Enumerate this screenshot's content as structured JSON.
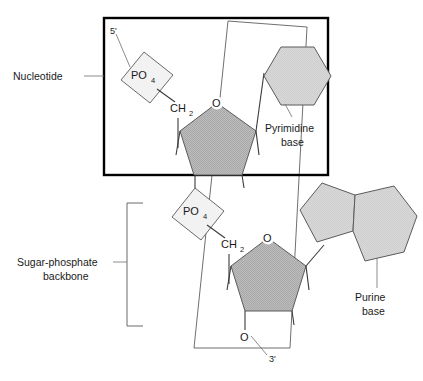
{
  "figure": {
    "background_color": "#ffffff"
  },
  "labels": {
    "nucleotide": "Nucleotide",
    "sugar_phosphate_line1": "Sugar-phosphate",
    "sugar_phosphate_line2": "backbone",
    "pyrimidine_line1": "Pyrimidine",
    "pyrimidine_line2": "base",
    "purine_line1": "Purine",
    "purine_line2": "base",
    "five_prime": "5'",
    "three_prime": "3'"
  },
  "chemistry": {
    "phosphate_main": "PO",
    "phosphate_sub": "4",
    "methylene_main": "CH",
    "methylene_sub": "2",
    "oxygen": "O"
  },
  "nucleotides": [
    {
      "id": "upper-nucleotide",
      "phosphate": {
        "main": "PO",
        "sub": "4"
      },
      "carbon": {
        "main": "CH",
        "sub": "2"
      },
      "ring_oxygen": "O",
      "base_type": "pyrimidine",
      "base_label_line1": "Pyrimidine",
      "base_label_line2": "base"
    },
    {
      "id": "lower-nucleotide",
      "phosphate": {
        "main": "PO",
        "sub": "4"
      },
      "carbon": {
        "main": "CH",
        "sub": "2"
      },
      "ring_oxygen_top": "O",
      "ring_oxygen_bottom": "O",
      "base_type": "purine",
      "base_label_line1": "Purine",
      "base_label_line2": "base"
    }
  ],
  "colors": {
    "sugar_fill": "#b9b9b9",
    "base_fill": "#d5d5d5",
    "phosphate_fill": "#f1f1f1",
    "outline": "#4a4a4a",
    "frame": "#000000",
    "text": "#1a1a1a",
    "leader": "#6e6e6e"
  }
}
